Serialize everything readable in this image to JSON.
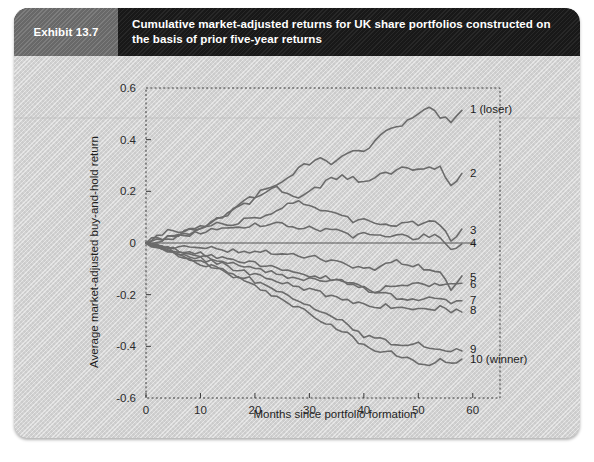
{
  "header": {
    "exhibit_tag": "Exhibit 13.7",
    "title": "Cumulative market-adjusted returns for UK share portfolios constructed on the basis of prior five-year returns"
  },
  "chart_data": {
    "type": "line",
    "title": "Cumulative market-adjusted returns for UK share portfolios constructed on the basis of prior five-year returns",
    "xlabel": "Months since portfolio formation",
    "ylabel": "Average market-adjusted buy-and-hold return",
    "xlim": [
      0,
      65
    ],
    "ylim": [
      -0.6,
      0.6
    ],
    "xticks": [
      0,
      10,
      20,
      30,
      40,
      50,
      60
    ],
    "xtick_labels": [
      "0",
      "10",
      "20",
      "30",
      "40",
      "50",
      "60"
    ],
    "yticks": [
      0.6,
      0.4,
      0.2,
      0,
      -0.2,
      -0.4,
      -0.6
    ],
    "ytick_labels": [
      "0.6",
      "0.4",
      "0.2",
      "0",
      "-0.2",
      "-0.4",
      "-0.6"
    ],
    "grid": false,
    "legend_position": "right-inline",
    "zero_reference_line": 0,
    "line_color": "#6b6b6b",
    "x": [
      0,
      2,
      4,
      6,
      8,
      10,
      12,
      14,
      16,
      18,
      20,
      22,
      24,
      26,
      28,
      30,
      32,
      34,
      36,
      38,
      40,
      42,
      44,
      46,
      48,
      50,
      52,
      54,
      56,
      58
    ],
    "series": [
      {
        "name": "1 (loser)",
        "label": "1 (loser)",
        "values": [
          0.0,
          0.02,
          0.01,
          0.03,
          0.04,
          0.05,
          0.08,
          0.1,
          0.13,
          0.16,
          0.18,
          0.21,
          0.22,
          0.25,
          0.29,
          0.31,
          0.33,
          0.3,
          0.34,
          0.36,
          0.35,
          0.4,
          0.43,
          0.45,
          0.47,
          0.5,
          0.52,
          0.49,
          0.47,
          0.52
        ]
      },
      {
        "name": "2",
        "label": "2",
        "values": [
          0.0,
          0.01,
          0.02,
          0.03,
          0.05,
          0.06,
          0.08,
          0.1,
          0.13,
          0.15,
          0.17,
          0.2,
          0.22,
          0.19,
          0.17,
          0.2,
          0.22,
          0.25,
          0.26,
          0.25,
          0.24,
          0.25,
          0.27,
          0.28,
          0.29,
          0.29,
          0.3,
          0.29,
          0.22,
          0.27
        ]
      },
      {
        "name": "3",
        "label": "3",
        "values": [
          0.0,
          0.03,
          0.05,
          0.04,
          0.05,
          0.06,
          0.07,
          0.08,
          0.07,
          0.09,
          0.1,
          0.11,
          0.13,
          0.15,
          0.16,
          0.14,
          0.13,
          0.12,
          0.11,
          0.08,
          0.09,
          0.08,
          0.07,
          0.07,
          0.08,
          0.07,
          0.08,
          0.07,
          0.01,
          0.05
        ]
      },
      {
        "name": "4",
        "label": "4",
        "values": [
          0.0,
          0.01,
          0.02,
          0.03,
          0.03,
          0.04,
          0.05,
          0.06,
          0.06,
          0.06,
          0.07,
          0.07,
          0.08,
          0.07,
          0.05,
          0.06,
          0.05,
          0.05,
          0.04,
          0.02,
          0.04,
          0.03,
          0.02,
          0.03,
          0.02,
          0.02,
          0.03,
          0.02,
          -0.03,
          0.0
        ]
      },
      {
        "name": "5",
        "label": "5",
        "values": [
          0.0,
          -0.01,
          -0.01,
          -0.02,
          -0.01,
          -0.02,
          -0.02,
          -0.03,
          -0.03,
          -0.03,
          -0.04,
          -0.03,
          -0.04,
          -0.04,
          -0.05,
          -0.05,
          -0.06,
          -0.07,
          -0.08,
          -0.09,
          -0.09,
          -0.1,
          -0.08,
          -0.07,
          -0.08,
          -0.09,
          -0.1,
          -0.11,
          -0.19,
          -0.13
        ]
      },
      {
        "name": "6",
        "label": "6",
        "values": [
          0.0,
          -0.01,
          -0.02,
          -0.03,
          -0.04,
          -0.04,
          -0.05,
          -0.06,
          -0.06,
          -0.07,
          -0.08,
          -0.09,
          -0.1,
          -0.11,
          -0.12,
          -0.13,
          -0.13,
          -0.14,
          -0.15,
          -0.16,
          -0.18,
          -0.19,
          -0.17,
          -0.16,
          -0.16,
          -0.16,
          -0.16,
          -0.16,
          -0.16,
          -0.16
        ]
      },
      {
        "name": "7",
        "label": "7",
        "values": [
          0.0,
          -0.01,
          -0.02,
          -0.03,
          -0.04,
          -0.05,
          -0.06,
          -0.07,
          -0.08,
          -0.09,
          -0.1,
          -0.11,
          -0.12,
          -0.13,
          -0.14,
          -0.14,
          -0.15,
          -0.14,
          -0.15,
          -0.16,
          -0.17,
          -0.19,
          -0.2,
          -0.21,
          -0.22,
          -0.22,
          -0.21,
          -0.22,
          -0.23,
          -0.22
        ]
      },
      {
        "name": "8",
        "label": "8",
        "values": [
          0.0,
          -0.01,
          -0.02,
          -0.04,
          -0.05,
          -0.06,
          -0.07,
          -0.08,
          -0.1,
          -0.11,
          -0.12,
          -0.13,
          -0.15,
          -0.16,
          -0.17,
          -0.18,
          -0.19,
          -0.21,
          -0.22,
          -0.23,
          -0.24,
          -0.25,
          -0.24,
          -0.25,
          -0.26,
          -0.25,
          -0.26,
          -0.25,
          -0.27,
          -0.26
        ]
      },
      {
        "name": "9",
        "label": "9",
        "values": [
          0.0,
          -0.01,
          -0.03,
          -0.04,
          -0.06,
          -0.07,
          -0.09,
          -0.1,
          -0.12,
          -0.13,
          -0.15,
          -0.17,
          -0.18,
          -0.2,
          -0.22,
          -0.24,
          -0.26,
          -0.28,
          -0.3,
          -0.33,
          -0.36,
          -0.37,
          -0.38,
          -0.39,
          -0.4,
          -0.39,
          -0.4,
          -0.41,
          -0.42,
          -0.41
        ]
      },
      {
        "name": "10 (winner)",
        "label": "10 (winner)",
        "values": [
          0.0,
          -0.02,
          -0.03,
          -0.05,
          -0.06,
          -0.08,
          -0.09,
          -0.11,
          -0.13,
          -0.15,
          -0.17,
          -0.19,
          -0.21,
          -0.23,
          -0.25,
          -0.27,
          -0.3,
          -0.32,
          -0.34,
          -0.37,
          -0.39,
          -0.41,
          -0.42,
          -0.43,
          -0.45,
          -0.46,
          -0.47,
          -0.45,
          -0.47,
          -0.45
        ]
      }
    ],
    "series_end_labels": [
      {
        "label": "1 (loser)",
        "y": 0.52
      },
      {
        "label": "2",
        "y": 0.27
      },
      {
        "label": "3",
        "y": 0.05
      },
      {
        "label": "4",
        "y": 0.0
      },
      {
        "label": "5",
        "y": -0.13
      },
      {
        "label": "6",
        "y": -0.16
      },
      {
        "label": "7",
        "y": -0.22
      },
      {
        "label": "8",
        "y": -0.26
      },
      {
        "label": "9",
        "y": -0.41
      },
      {
        "label": "10 (winner)",
        "y": -0.45
      }
    ]
  }
}
